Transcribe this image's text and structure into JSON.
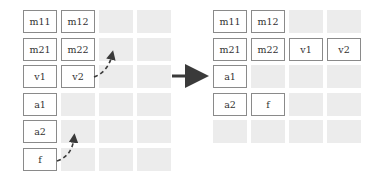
{
  "colors": {
    "cell_border": "#8a8a8a",
    "empty_cell": "#ececec",
    "arrow": "#3a3a3a",
    "text": "#333333"
  },
  "left_grid": {
    "rows": [
      [
        "m11",
        "m12",
        "",
        ""
      ],
      [
        "m21",
        "m22",
        "",
        ""
      ],
      [
        "v1",
        "v2",
        "",
        ""
      ],
      [
        "a1",
        "",
        "",
        ""
      ],
      [
        "a2",
        "",
        "",
        ""
      ],
      [
        "f",
        "",
        "",
        ""
      ]
    ]
  },
  "right_grid": {
    "rows": [
      [
        "m11",
        "m12",
        "",
        ""
      ],
      [
        "m21",
        "m22",
        "v1",
        "v2"
      ],
      [
        "a1",
        "",
        "",
        ""
      ],
      [
        "a2",
        "f",
        "",
        ""
      ],
      [
        "",
        "",
        "",
        ""
      ]
    ]
  },
  "arrows": {
    "main": "transform-arrow",
    "dashed": [
      "v2-move-arrow",
      "f-move-arrow"
    ]
  }
}
